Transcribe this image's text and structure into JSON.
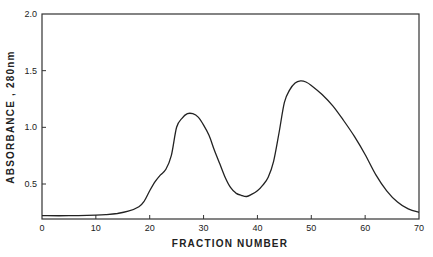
{
  "chart_data": {
    "type": "line",
    "title": "",
    "xlabel": "FRACTION NUMBER",
    "ylabel": "ABSORBANCE , 280nm",
    "xlim": [
      0,
      70
    ],
    "ylim": [
      0.19,
      2.0
    ],
    "grid": false,
    "legend": null,
    "x_ticks": [
      0,
      10,
      20,
      30,
      40,
      50,
      60,
      70
    ],
    "x_tick_labels": [
      "0",
      "10",
      "20",
      "30",
      "40",
      "50",
      "60",
      "70"
    ],
    "y_ticks": [
      0.5,
      1.0,
      1.5,
      2.0
    ],
    "y_tick_labels": [
      "0.5",
      "1.0",
      "1.5",
      "2.0"
    ],
    "series": [
      {
        "name": "Absorbance 280nm",
        "color": "#222222",
        "x": [
          0,
          5,
          10,
          12,
          14,
          16,
          18,
          19,
          20,
          21,
          22,
          23,
          24,
          25,
          26,
          27,
          28,
          29,
          30,
          31,
          32,
          33,
          34,
          35,
          36,
          37,
          38,
          39,
          40,
          41,
          42,
          43,
          44,
          45,
          46,
          47,
          48,
          49,
          50,
          52,
          54,
          56,
          58,
          60,
          62,
          64,
          66,
          68,
          70
        ],
        "values": [
          0.22,
          0.22,
          0.225,
          0.23,
          0.24,
          0.26,
          0.3,
          0.35,
          0.44,
          0.52,
          0.58,
          0.63,
          0.75,
          1.0,
          1.08,
          1.12,
          1.12,
          1.09,
          1.02,
          0.93,
          0.8,
          0.68,
          0.56,
          0.47,
          0.42,
          0.4,
          0.39,
          0.41,
          0.44,
          0.49,
          0.56,
          0.7,
          0.95,
          1.22,
          1.33,
          1.39,
          1.41,
          1.4,
          1.37,
          1.29,
          1.19,
          1.06,
          0.92,
          0.76,
          0.58,
          0.44,
          0.34,
          0.28,
          0.25
        ]
      }
    ]
  }
}
